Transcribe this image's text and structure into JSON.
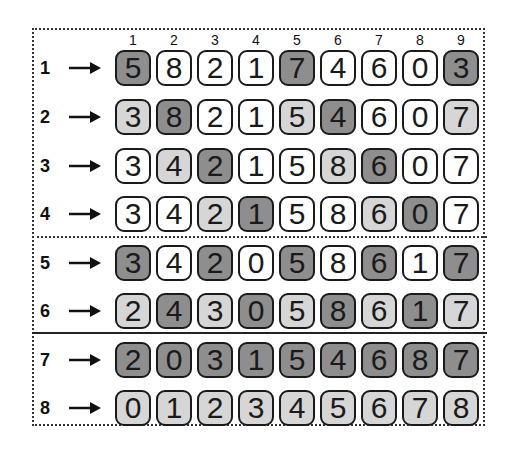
{
  "column_headers": [
    "1",
    "2",
    "3",
    "4",
    "5",
    "6",
    "7",
    "8",
    "9"
  ],
  "shade_legend": {
    "0": "white",
    "1": "light-gray",
    "2": "dark-gray"
  },
  "colors": {
    "white": "#ffffff",
    "light": "#d6d6d6",
    "dark": "#8e8e8e",
    "border": "#1a1a1a"
  },
  "rows": [
    {
      "label": "1",
      "arrow": "→",
      "values": [
        "5",
        "8",
        "2",
        "1",
        "7",
        "4",
        "6",
        "0",
        "3"
      ],
      "shades": [
        2,
        0,
        0,
        0,
        2,
        0,
        0,
        0,
        2
      ]
    },
    {
      "label": "2",
      "arrow": "→",
      "values": [
        "3",
        "8",
        "2",
        "1",
        "5",
        "4",
        "6",
        "0",
        "7"
      ],
      "shades": [
        1,
        2,
        0,
        0,
        1,
        2,
        0,
        0,
        1
      ]
    },
    {
      "label": "3",
      "arrow": "→",
      "values": [
        "3",
        "4",
        "2",
        "1",
        "5",
        "8",
        "6",
        "0",
        "7"
      ],
      "shades": [
        0,
        1,
        2,
        0,
        0,
        1,
        2,
        0,
        0
      ]
    },
    {
      "label": "4",
      "arrow": "→",
      "values": [
        "3",
        "4",
        "2",
        "1",
        "5",
        "8",
        "6",
        "0",
        "7"
      ],
      "shades": [
        0,
        0,
        1,
        2,
        0,
        0,
        1,
        2,
        0
      ]
    },
    {
      "label": "5",
      "arrow": "→",
      "values": [
        "3",
        "4",
        "2",
        "0",
        "5",
        "8",
        "6",
        "1",
        "7"
      ],
      "shades": [
        2,
        0,
        2,
        0,
        2,
        0,
        2,
        0,
        2
      ]
    },
    {
      "label": "6",
      "arrow": "→",
      "values": [
        "2",
        "4",
        "3",
        "0",
        "5",
        "8",
        "6",
        "1",
        "7"
      ],
      "shades": [
        1,
        2,
        1,
        2,
        1,
        2,
        1,
        2,
        1
      ]
    },
    {
      "label": "7",
      "arrow": "→",
      "values": [
        "2",
        "0",
        "3",
        "1",
        "5",
        "4",
        "6",
        "8",
        "7"
      ],
      "shades": [
        2,
        2,
        2,
        2,
        2,
        2,
        2,
        2,
        2
      ]
    },
    {
      "label": "8",
      "arrow": "→",
      "values": [
        "0",
        "1",
        "2",
        "3",
        "4",
        "5",
        "6",
        "7",
        "8"
      ],
      "shades": [
        1,
        1,
        1,
        1,
        1,
        1,
        1,
        1,
        1
      ]
    }
  ],
  "group_separators": [
    {
      "after_row": 4,
      "style": "dotted"
    },
    {
      "after_row": 6,
      "style": "solid"
    }
  ]
}
